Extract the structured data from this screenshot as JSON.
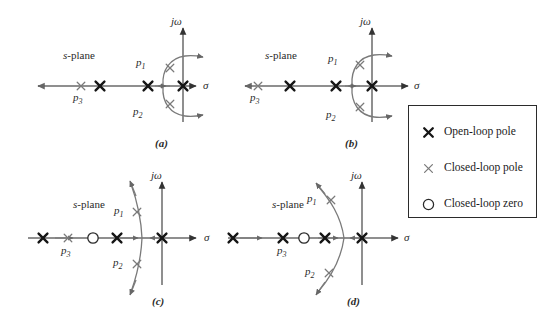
{
  "figure": {
    "background_color": "#ffffff",
    "line_color": "#555555",
    "marker_bold_color": "#1a1a1a",
    "marker_light_color": "#6f6f6f",
    "text_color": "#2a2a2a"
  },
  "axis_labels": {
    "imaginary": "jω",
    "real": "σ",
    "plane_italic": "s",
    "plane_roman": "-plane"
  },
  "pole_labels": {
    "p1": "p",
    "p1_sub": "1",
    "p2": "p",
    "p2_sub": "2",
    "p3": "p",
    "p3_sub": "3"
  },
  "panels": [
    {
      "id": "a",
      "caption": "(a)",
      "plane_label": "s-plane",
      "sigma_label": "σ",
      "jomega_label": "jω",
      "labels": [
        "p1",
        "p2",
        "p3"
      ],
      "open_loop_poles_count": 3,
      "closed_loop_poles_count": 3,
      "closed_loop_zeros_count": 0,
      "locus_shape": "breakaway-to-right-half-plane",
      "description": "Closed-loop poles near origin on vertical arcs crossing into right half plane"
    },
    {
      "id": "b",
      "caption": "(b)",
      "plane_label": "s-plane",
      "sigma_label": "σ",
      "jomega_label": "jω",
      "labels": [
        "p1",
        "p2",
        "p3"
      ],
      "open_loop_poles_count": 3,
      "closed_loop_poles_count": 3,
      "closed_loop_zeros_count": 0,
      "locus_shape": "breakaway-to-right-half-plane",
      "description": "Same as (a) with closed-loop poles moved farther along the arcs"
    },
    {
      "id": "c",
      "caption": "(c)",
      "plane_label": "s-plane",
      "sigma_label": "σ",
      "jomega_label": "jω",
      "labels": [
        "p1",
        "p2",
        "p3"
      ],
      "open_loop_poles_count": 3,
      "closed_loop_poles_count": 3,
      "closed_loop_zeros_count": 1,
      "locus_shape": "vertical-arc-left-of-jomega-axis",
      "description": "Compensating zero added; locus bends into left half plane"
    },
    {
      "id": "d",
      "caption": "(d)",
      "plane_label": "s-plane",
      "sigma_label": "σ",
      "jomega_label": "jω",
      "labels": [
        "p1",
        "p2",
        "p3"
      ],
      "open_loop_poles_count": 3,
      "closed_loop_poles_count": 3,
      "closed_loop_zeros_count": 1,
      "locus_shape": "vertical-arc-left-of-jomega-axis",
      "description": "Zero placed farther left; locus fully in left half plane"
    }
  ],
  "legend": {
    "items": [
      {
        "marker": "bold-x-marker",
        "label": "Open-loop pole"
      },
      {
        "marker": "light-x-marker",
        "label": "Closed-loop pole"
      },
      {
        "marker": "circle-marker",
        "label": "Closed-loop zero"
      }
    ]
  }
}
